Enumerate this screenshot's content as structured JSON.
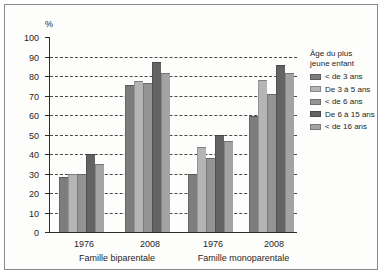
{
  "chart_data": {
    "type": "bar",
    "title": "",
    "xlabel": "",
    "ylabel": "%",
    "ylim": [
      0,
      100
    ],
    "ytick_step": 10,
    "yticks": [
      0,
      10,
      20,
      30,
      40,
      50,
      60,
      70,
      80,
      90,
      100
    ],
    "grid": true,
    "legend_position": "right",
    "legend_title": "Âge du plus jeune enfant",
    "legend_title_lines": [
      "Âge du plus",
      "jeune enfant"
    ],
    "categories": [
      "1976",
      "2008",
      "1976",
      "2008"
    ],
    "group_labels": [
      "Famille biparentale",
      "Famille monoparentale"
    ],
    "groups": [
      {
        "panel": "Famille biparentale",
        "category": "1976",
        "values": [
          28,
          29.5,
          29.5,
          40,
          35
        ]
      },
      {
        "panel": "Famille biparentale",
        "category": "2008",
        "values": [
          75.5,
          77.5,
          76.5,
          87,
          81.5
        ]
      },
      {
        "panel": "Famille monoparentale",
        "category": "1976",
        "values": [
          30,
          43.5,
          38,
          49.5,
          46.5
        ]
      },
      {
        "panel": "Famille monoparentale",
        "category": "2008",
        "values": [
          59.5,
          78,
          71,
          85.5,
          81.5
        ]
      }
    ],
    "series": [
      {
        "name": "< de 3 ans",
        "color": "#7d7d7d",
        "values": [
          28,
          75.5,
          30,
          59.5
        ]
      },
      {
        "name": "De 3 à 5 ans",
        "color": "#b5b5b5",
        "values": [
          29.5,
          77.5,
          43.5,
          78
        ]
      },
      {
        "name": "< de 6 ans",
        "color": "#949494",
        "values": [
          29.5,
          76.5,
          38,
          71
        ]
      },
      {
        "name": "De 6 à 15 ans",
        "color": "#636363",
        "values": [
          40,
          87,
          49.5,
          85.5
        ]
      },
      {
        "name": "< de 16 ans",
        "color": "#a3a3a3",
        "values": [
          35,
          81.5,
          46.5,
          81.5
        ]
      }
    ]
  },
  "axis": {
    "y_unit": "%",
    "tick_labels": [
      "100",
      "90",
      "80",
      "70",
      "60",
      "50",
      "40",
      "30",
      "20",
      "10",
      "0"
    ]
  },
  "colors": {
    "frame": "#8a8a8a",
    "axis": "#2b2b2b",
    "grid": "#4a4a4a",
    "background": "#fdfdfc"
  }
}
